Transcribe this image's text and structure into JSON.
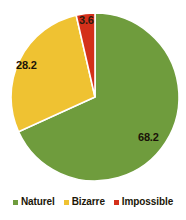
{
  "chart_data": {
    "type": "pie",
    "title": "",
    "subtitle": "",
    "xlabel": "",
    "ylabel": "",
    "categories": [
      "Naturel",
      "Bizarre",
      "Impossible"
    ],
    "values": [
      68.2,
      28.2,
      3.6
    ],
    "value_labels": [
      "68.2",
      "28.2",
      "3.6"
    ],
    "colors": [
      "#6f9c3d",
      "#efc232",
      "#d4301a"
    ],
    "start_angle_deg": 0,
    "direction": "clockwise",
    "grid": false,
    "legend_position": "bottom",
    "slices": [
      {
        "name": "Naturel",
        "value": 68.2,
        "label": "68.2",
        "color": "#6f9c3d"
      },
      {
        "name": "Bizarre",
        "value": 28.2,
        "label": "28.2",
        "color": "#efc232"
      },
      {
        "name": "Impossible",
        "value": 3.6,
        "label": "3.6",
        "color": "#d4301a"
      }
    ]
  },
  "legend": {
    "items": [
      {
        "label": "Naturel",
        "color": "#6f9c3d",
        "marker": "square-marker-green"
      },
      {
        "label": "Bizarre",
        "color": "#efc232",
        "marker": "square-marker-yellow"
      },
      {
        "label": "Impossible",
        "color": "#d4301a",
        "marker": "square-marker-red"
      }
    ]
  }
}
